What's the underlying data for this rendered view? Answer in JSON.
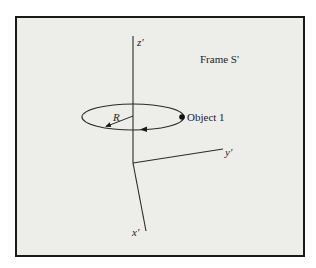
{
  "title": "Frame S'",
  "axes": {
    "z": "z′",
    "y": "y′",
    "x": "x′"
  },
  "radius_label": "R",
  "object_label": "Object 1",
  "colors": {
    "background": "#ededea",
    "border": "#1a1a1a",
    "lines": "#2a2a2a"
  }
}
